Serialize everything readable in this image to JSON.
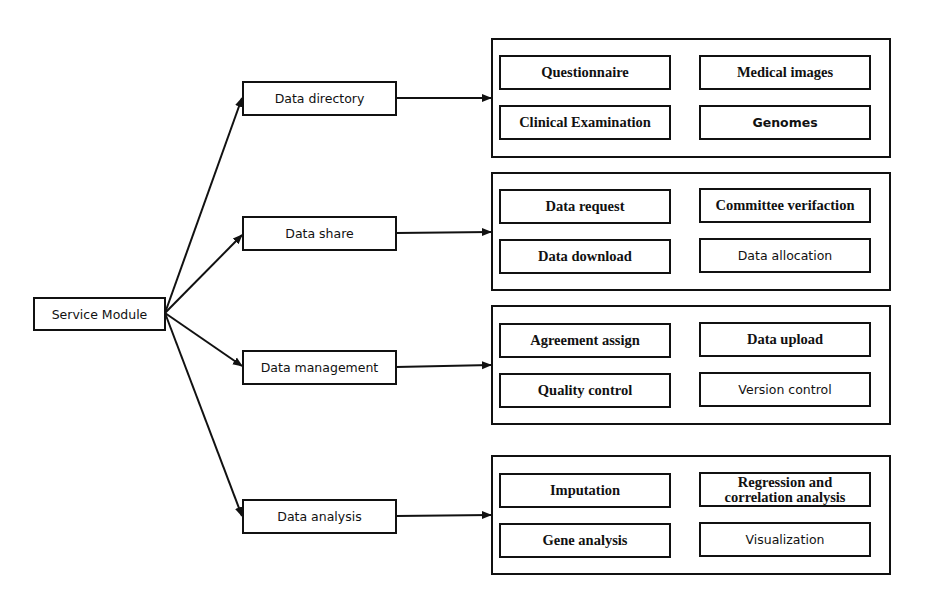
{
  "root": {
    "label": "Service Module"
  },
  "modules": [
    {
      "label": "Data directory",
      "items": [
        "Questionnaire",
        "Medical images",
        "Clinical Examination",
        "Genomes"
      ]
    },
    {
      "label": "Data share",
      "items": [
        "Data request",
        "Committee verifaction",
        "Data download",
        "Data allocation"
      ]
    },
    {
      "label": "Data management",
      "items": [
        "Agreement assign",
        "Data upload",
        "Quality control",
        "Version control"
      ]
    },
    {
      "label": "Data analysis",
      "items": [
        "Imputation",
        "Regression and correlation analysis",
        "Gene analysis",
        "Visualization"
      ]
    }
  ],
  "colors": {
    "line": "#111111",
    "background": "#ffffff"
  }
}
